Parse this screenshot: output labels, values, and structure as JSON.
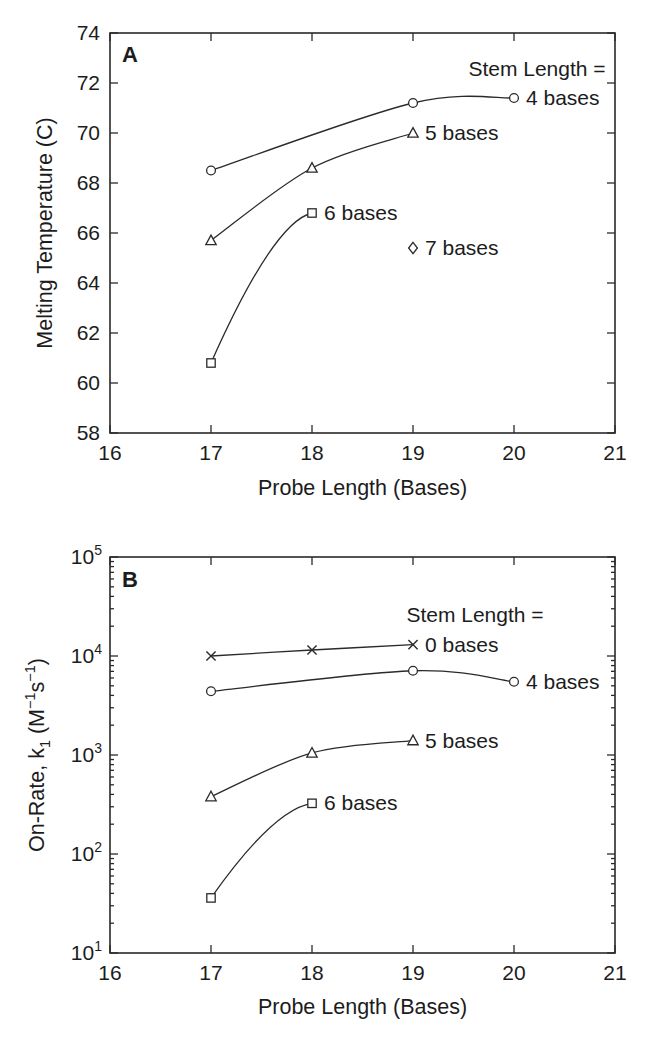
{
  "figure": {
    "background": "#ffffff",
    "line_color": "#2a2a2a",
    "text_color": "#1c1c1c"
  },
  "chart_data": [
    {
      "id": "panel_a",
      "type": "line",
      "panel_label": "A",
      "xlabel": "Probe Length (Bases)",
      "ylabel": "Melting Temperature (C)",
      "yscale": "linear",
      "xlim": [
        16,
        21
      ],
      "ylim": [
        58,
        74
      ],
      "xticks": [
        16,
        17,
        18,
        19,
        20,
        21
      ],
      "yticks": [
        58,
        60,
        62,
        64,
        66,
        68,
        70,
        72,
        74
      ],
      "grid": false,
      "legend_title": "Stem Length =",
      "layout": {
        "box": {
          "left": 110,
          "top": 33,
          "right": 615,
          "bottom": 433
        },
        "legend_title_pos": {
          "x": 537,
          "y": 76
        },
        "panel_label_pos": {
          "x": 122,
          "y": 62
        },
        "xlabel_offset": 62,
        "xticklabel_offset": 27,
        "ylabel_x": 52
      },
      "series": [
        {
          "name": "4 bases",
          "marker": "circle",
          "x": [
            17,
            19,
            20
          ],
          "y": [
            68.5,
            71.2,
            71.4
          ],
          "label": "4 bases"
        },
        {
          "name": "5 bases",
          "marker": "triangle",
          "x": [
            17,
            18,
            19
          ],
          "y": [
            65.7,
            68.6,
            70.0
          ],
          "label": "5 bases"
        },
        {
          "name": "6 bases",
          "marker": "square",
          "x": [
            17,
            18
          ],
          "y": [
            60.8,
            66.8
          ],
          "label": "6 bases"
        },
        {
          "name": "7 bases",
          "marker": "diamond",
          "x": [
            19
          ],
          "y": [
            65.4
          ],
          "label": "7 bases"
        }
      ]
    },
    {
      "id": "panel_b",
      "type": "line",
      "panel_label": "B",
      "xlabel": "Probe Length (Bases)",
      "ylabel_rich": [
        {
          "t": "On-Rate, k"
        },
        {
          "t": "1",
          "shift": "sub"
        },
        {
          "t": " (M"
        },
        {
          "t": "−1",
          "shift": "sup"
        },
        {
          "t": "s"
        },
        {
          "t": "−1",
          "shift": "sup"
        },
        {
          "t": ")"
        }
      ],
      "yscale": "log",
      "xlim": [
        16,
        21
      ],
      "ylim_exp": [
        1,
        5
      ],
      "xticks": [
        16,
        17,
        18,
        19,
        20,
        21
      ],
      "ytick_exponents": [
        1,
        2,
        3,
        4,
        5
      ],
      "grid": false,
      "legend_title": "Stem Length =",
      "layout": {
        "box": {
          "left": 110,
          "top": 37,
          "right": 615,
          "bottom": 433
        },
        "legend_title_pos": {
          "x": 475,
          "y": 102
        },
        "panel_label_pos": {
          "x": 122,
          "y": 67
        },
        "xlabel_offset": 61,
        "xticklabel_offset": 27,
        "ylabel_x": 44
      },
      "series": [
        {
          "name": "0 bases",
          "marker": "x",
          "x": [
            17,
            18,
            19
          ],
          "y": [
            10000,
            11500,
            13000
          ],
          "label": "0 bases"
        },
        {
          "name": "4 bases",
          "marker": "circle",
          "x": [
            17,
            19,
            20
          ],
          "y": [
            4400,
            7100,
            5500
          ],
          "label": "4 bases"
        },
        {
          "name": "5 bases",
          "marker": "triangle",
          "x": [
            17,
            18,
            19
          ],
          "y": [
            380,
            1050,
            1400
          ],
          "label": "5 bases"
        },
        {
          "name": "6 bases",
          "marker": "square",
          "x": [
            17,
            18
          ],
          "y": [
            36,
            325
          ],
          "label": "6 bases"
        }
      ]
    }
  ]
}
